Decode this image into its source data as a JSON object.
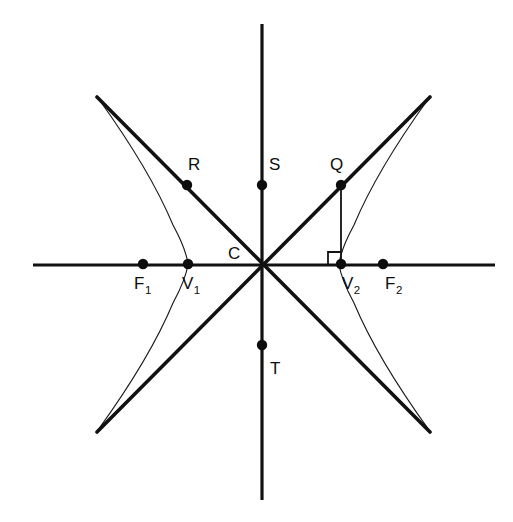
{
  "figure": {
    "title": "Hyperbola with foci, vertices, center and asymptotes",
    "width": 513,
    "height": 522,
    "background_color": "#ffffff",
    "ink_color": "#111111"
  },
  "geometry": {
    "center": {
      "x": 262,
      "y": 264
    },
    "semi_transverse_axis_a": 74,
    "semi_conjugate_axis_b": 74,
    "focal_distance_c": 119,
    "asymptote_slope": 1.0
  },
  "axes": {
    "horizontal": {
      "x1": 33,
      "y1": 265,
      "x2": 495,
      "y2": 265,
      "label": "transverse-axis"
    },
    "vertical": {
      "x1": 262,
      "y1": 24,
      "x2": 262,
      "y2": 500,
      "label": "conjugate-axis"
    }
  },
  "asymptotes": [
    {
      "name": "asymptote-rising",
      "x1": 97,
      "y1": 432,
      "x2": 430,
      "y2": 97
    },
    {
      "name": "asymptote-falling",
      "x1": 97,
      "y1": 97,
      "x2": 430,
      "y2": 432
    }
  ],
  "branches": [
    {
      "name": "left-branch",
      "path": "M 98 98 Q 150 170 173 225 Q 186 249 188 264 Q 186 279 173 303 Q 150 358 98 430"
    },
    {
      "name": "right-branch",
      "path": "M 429 98 Q 377 170 354 225 Q 341 249 339 264 Q 341 279 354 303 Q 377 358 429 430"
    }
  ],
  "connector": {
    "name": "q-to-v2-segment",
    "x1": 341,
    "y1": 185,
    "x2": 341,
    "y2": 264
  },
  "right_angle_marker": {
    "name": "right-angle-at-v2",
    "path": "M 328 264 L 328 252 L 341 252"
  },
  "points": [
    {
      "id": "F1",
      "label": "F",
      "sub": "1",
      "x": 143,
      "y": 264,
      "label_x": 134,
      "label_y": 289,
      "dot": true,
      "role": "focus-left"
    },
    {
      "id": "V1",
      "label": "V",
      "sub": "1",
      "x": 188,
      "y": 264,
      "label_x": 182,
      "label_y": 289,
      "dot": true,
      "role": "vertex-left"
    },
    {
      "id": "C",
      "label": "C",
      "sub": "",
      "x": 262,
      "y": 264,
      "label_x": 228,
      "label_y": 259,
      "dot": false,
      "role": "center"
    },
    {
      "id": "V2",
      "label": "V",
      "sub": "2",
      "x": 341,
      "y": 264,
      "label_x": 342,
      "label_y": 289,
      "dot": true,
      "role": "vertex-right"
    },
    {
      "id": "F2",
      "label": "F",
      "sub": "2",
      "x": 383,
      "y": 264,
      "label_x": 385,
      "label_y": 289,
      "dot": true,
      "role": "focus-right"
    },
    {
      "id": "R",
      "label": "R",
      "sub": "",
      "x": 187,
      "y": 185,
      "label_x": 188,
      "label_y": 170,
      "dot": true,
      "role": "point-on-asymptote"
    },
    {
      "id": "S",
      "label": "S",
      "sub": "",
      "x": 262,
      "y": 185,
      "label_x": 269,
      "label_y": 170,
      "dot": true,
      "role": "point-on-conjugate-axis-up"
    },
    {
      "id": "Q",
      "label": "Q",
      "sub": "",
      "x": 341,
      "y": 185,
      "label_x": 330,
      "label_y": 170,
      "dot": true,
      "role": "point-on-asymptote"
    },
    {
      "id": "T",
      "label": "T",
      "sub": "",
      "x": 262,
      "y": 345,
      "label_x": 270,
      "label_y": 374,
      "dot": true,
      "role": "point-on-conjugate-axis-down"
    }
  ],
  "dot_radius": 5.2
}
